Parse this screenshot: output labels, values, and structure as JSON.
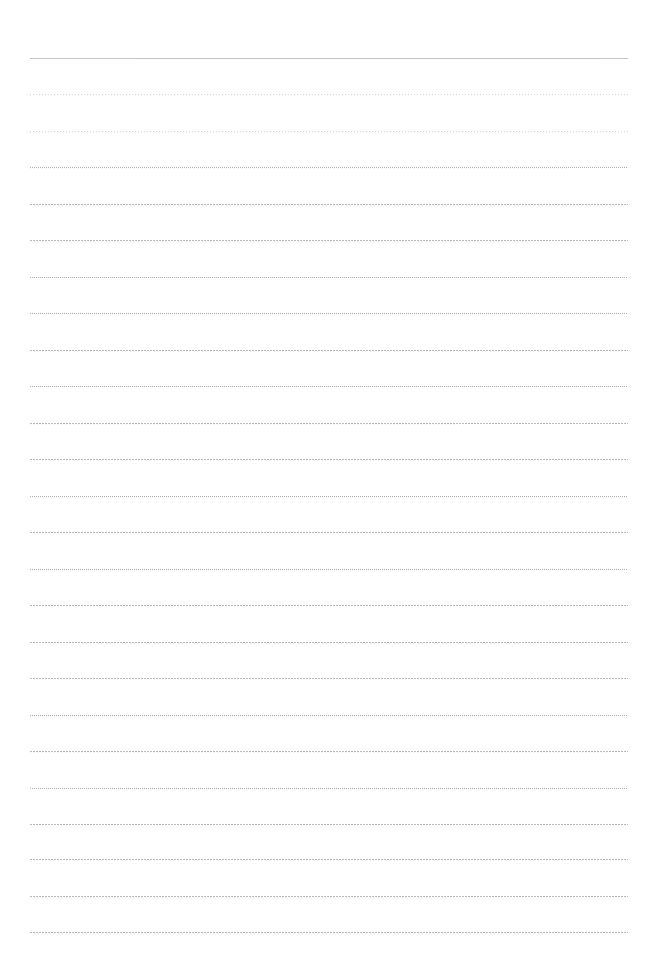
{
  "page": {
    "background_color": "#ffffff",
    "width": 658,
    "height": 965,
    "content_text": "",
    "rule_color": "#8a8c94",
    "rule_color_light": "#b4b6be"
  },
  "ruling": {
    "line_count": 25,
    "first_line_y": 58,
    "line_spacing": 36.4,
    "left_x": 30,
    "right_x": 628,
    "line_width": 598,
    "lines": [
      {
        "index": 1,
        "y": 58,
        "style": "solid",
        "ghost": true,
        "ghost_start": 0.18,
        "ghost_end": 0.95
      },
      {
        "index": 2,
        "y": 94,
        "style": "faint",
        "ghost": true,
        "ghost_start": 0.0,
        "ghost_end": 0.62
      },
      {
        "index": 3,
        "y": 131,
        "style": "faint",
        "ghost": true,
        "ghost_start": 0.0,
        "ghost_end": 0.98
      },
      {
        "index": 4,
        "y": 167,
        "style": "dotted",
        "ghost": true,
        "ghost_start": 0.0,
        "ghost_end": 0.9
      },
      {
        "index": 5,
        "y": 204,
        "style": "dense",
        "ghost": true,
        "ghost_start": 0.0,
        "ghost_end": 1.0
      },
      {
        "index": 6,
        "y": 240,
        "style": "dense",
        "ghost": true,
        "ghost_start": 0.0,
        "ghost_end": 0.85
      },
      {
        "index": 7,
        "y": 277,
        "style": "dotted",
        "ghost": false,
        "ghost_start": 0.0,
        "ghost_end": 0.0
      },
      {
        "index": 8,
        "y": 313,
        "style": "dotted",
        "ghost": true,
        "ghost_start": 0.1,
        "ghost_end": 0.8
      },
      {
        "index": 9,
        "y": 350,
        "style": "dense",
        "ghost": true,
        "ghost_start": 0.0,
        "ghost_end": 0.96
      },
      {
        "index": 10,
        "y": 386,
        "style": "dotted",
        "ghost": false,
        "ghost_start": 0.0,
        "ghost_end": 0.0
      },
      {
        "index": 11,
        "y": 423,
        "style": "dense",
        "ghost": true,
        "ghost_start": 0.0,
        "ghost_end": 0.72
      },
      {
        "index": 12,
        "y": 459,
        "style": "dense",
        "ghost": true,
        "ghost_start": 0.0,
        "ghost_end": 0.88
      },
      {
        "index": 13,
        "y": 496,
        "style": "dotted",
        "ghost": true,
        "ghost_start": 0.12,
        "ghost_end": 0.94
      },
      {
        "index": 14,
        "y": 532,
        "style": "dense",
        "ghost": false,
        "ghost_start": 0.0,
        "ghost_end": 0.0
      },
      {
        "index": 15,
        "y": 569,
        "style": "dotted",
        "ghost": true,
        "ghost_start": 0.0,
        "ghost_end": 0.66
      },
      {
        "index": 16,
        "y": 605,
        "style": "dense",
        "ghost": true,
        "ghost_start": 0.0,
        "ghost_end": 0.92
      },
      {
        "index": 17,
        "y": 642,
        "style": "dense",
        "ghost": true,
        "ghost_start": 0.08,
        "ghost_end": 0.82
      },
      {
        "index": 18,
        "y": 678,
        "style": "dense",
        "ghost": false,
        "ghost_start": 0.0,
        "ghost_end": 0.0
      },
      {
        "index": 19,
        "y": 715,
        "style": "dotted",
        "ghost": true,
        "ghost_start": 0.0,
        "ghost_end": 0.75
      },
      {
        "index": 20,
        "y": 751,
        "style": "dense",
        "ghost": true,
        "ghost_start": 0.0,
        "ghost_end": 0.97
      },
      {
        "index": 21,
        "y": 788,
        "style": "dotted",
        "ghost": true,
        "ghost_start": 0.14,
        "ghost_end": 0.89
      },
      {
        "index": 22,
        "y": 824,
        "style": "dense",
        "ghost": false,
        "ghost_start": 0.0,
        "ghost_end": 0.0
      },
      {
        "index": 23,
        "y": 859,
        "style": "dense",
        "ghost": true,
        "ghost_start": 0.0,
        "ghost_end": 0.93
      },
      {
        "index": 24,
        "y": 896,
        "style": "dense",
        "ghost": true,
        "ghost_start": 0.0,
        "ghost_end": 0.7
      },
      {
        "index": 25,
        "y": 932,
        "style": "dense",
        "ghost": true,
        "ghost_start": 0.0,
        "ghost_end": 0.86
      }
    ]
  }
}
